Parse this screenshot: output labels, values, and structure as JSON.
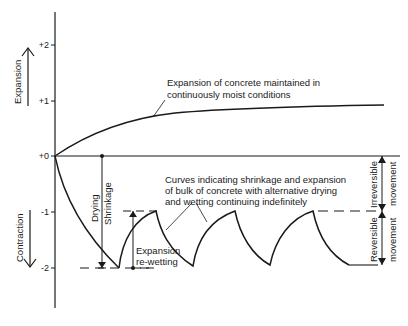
{
  "diagram": {
    "y_axis": {
      "ticks": [
        "+2",
        "+1",
        "+0",
        "-1",
        "-2"
      ],
      "upper_label": "Expansion",
      "lower_label": "Contraction"
    },
    "annotations": {
      "moist_line1": "Expansion of concrete maintained in",
      "moist_line2": "continuously moist conditions",
      "drying": "Drying",
      "shrinkage": "Shrinkage",
      "curves_line1": "Curves indicating shrinkage and expansion",
      "curves_line2": "of bulk of concrete with alternative drying",
      "curves_line3": "and wetting continuing indefinitely",
      "expansion": "Expansion",
      "rewetting": "re-wetting",
      "irreversible1": "Irreversible",
      "irreversible2": "movement",
      "reversible1": "Reversible",
      "reversible2": "movement"
    }
  }
}
